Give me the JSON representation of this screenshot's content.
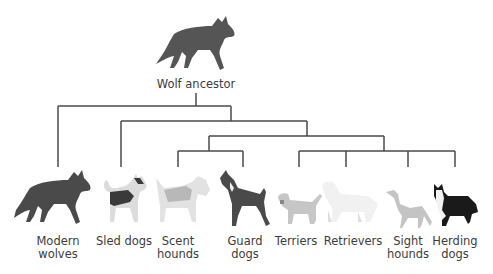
{
  "diagram": {
    "type": "phylogenetic-tree",
    "root": {
      "label": "Wolf ancestor",
      "icon": "wolf-icon"
    },
    "leaves": [
      {
        "id": "modern-wolves",
        "line1": "Modern",
        "line2": "wolves",
        "icon": "wolf-icon",
        "x": 58,
        "color": "#4a4a4a"
      },
      {
        "id": "sled-dogs",
        "line1": "Sled dogs",
        "line2": "",
        "icon": "husky-icon",
        "x": 121,
        "color": "#d8d8d8"
      },
      {
        "id": "scent-hounds",
        "line1": "Scent",
        "line2": "hounds",
        "icon": "beagle-icon",
        "x": 178,
        "color": "#e0e0e0"
      },
      {
        "id": "guard-dogs",
        "line1": "Guard",
        "line2": "dogs",
        "icon": "doberman-icon",
        "x": 243,
        "color": "#4a4a4a"
      },
      {
        "id": "terriers",
        "line1": "Terriers",
        "line2": "",
        "icon": "terrier-icon",
        "x": 299,
        "color": "#c8c8c8"
      },
      {
        "id": "retrievers",
        "line1": "Retrievers",
        "line2": "",
        "icon": "retriever-icon",
        "x": 346,
        "color": "#f0f0f0"
      },
      {
        "id": "sight-hounds",
        "line1": "Sight",
        "line2": "hounds",
        "icon": "greyhound-icon",
        "x": 408,
        "color": "#c4c4c4"
      },
      {
        "id": "herding-dogs",
        "line1": "Herding",
        "line2": "dogs",
        "icon": "collie-icon",
        "x": 455,
        "color": "#1a1a1a"
      }
    ],
    "branches": [
      {
        "children": [
          "modern-wolves",
          "rest-1"
        ]
      },
      {
        "children": [
          "sled-dogs",
          "rest-2"
        ]
      },
      {
        "children": [
          "group-a",
          "group-b"
        ]
      },
      {
        "id": "group-a",
        "children": [
          "scent-hounds",
          "guard-dogs"
        ]
      },
      {
        "id": "group-b",
        "children": [
          "terriers",
          "retrievers",
          "sight-hounds",
          "herding-dogs"
        ]
      }
    ],
    "line_color": "#4a4a4a"
  }
}
